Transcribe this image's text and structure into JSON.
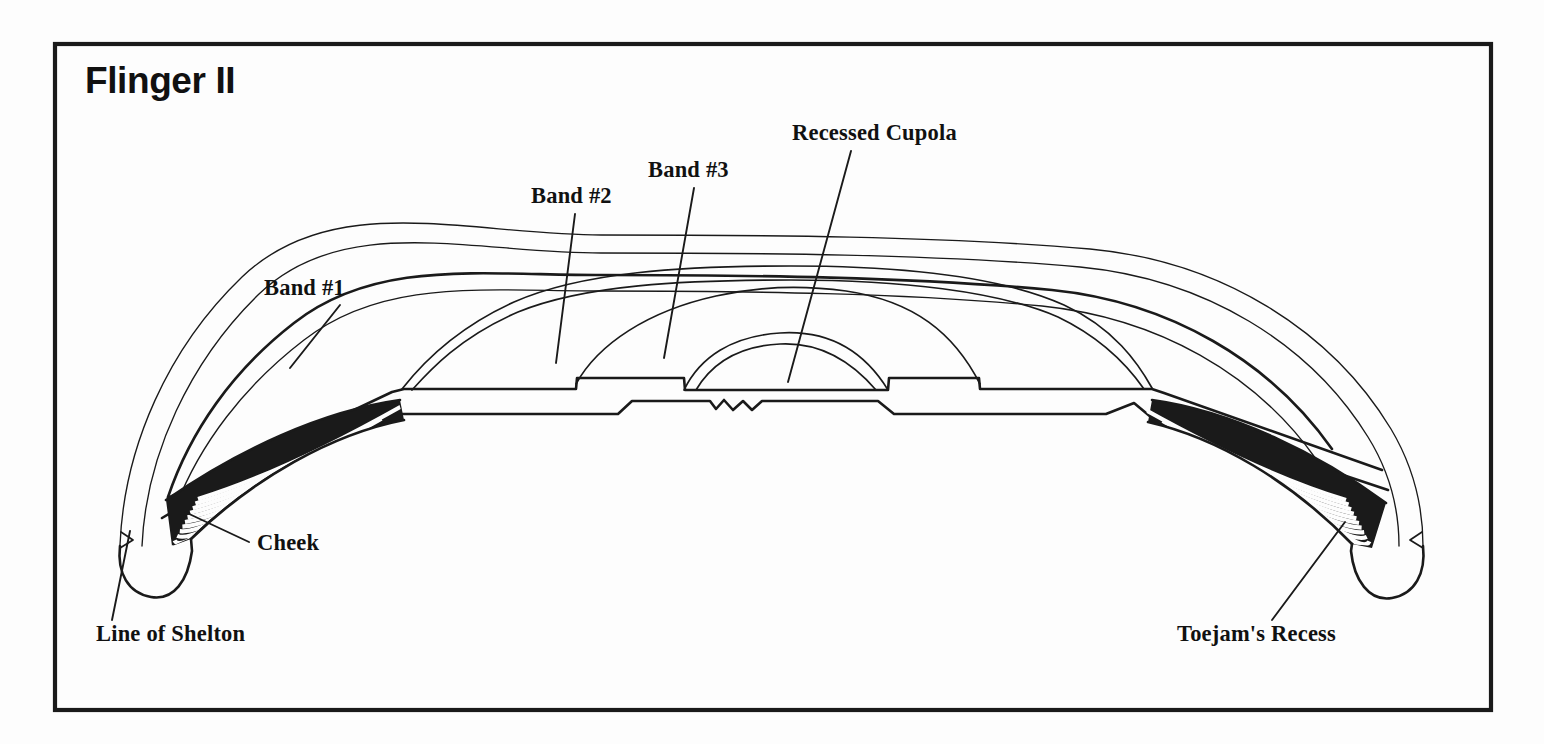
{
  "figure": {
    "title": "Flinger II",
    "background_color": "#fdfdfd",
    "ink_color": "#1a1a1a",
    "frame": {
      "x": 55,
      "y": 44,
      "width": 1436,
      "height": 666
    }
  },
  "callouts": [
    {
      "id": "band-1",
      "label": "Band #1",
      "text_x": 264,
      "text_y": 295,
      "leader": {
        "x1": 340,
        "y1": 305,
        "x2": 290,
        "y2": 368
      }
    },
    {
      "id": "band-2",
      "label": "Band #2",
      "text_x": 531,
      "text_y": 203,
      "leader": {
        "x1": 575,
        "y1": 214,
        "x2": 556,
        "y2": 363
      }
    },
    {
      "id": "band-3",
      "label": "Band #3",
      "text_x": 648,
      "text_y": 177,
      "leader": {
        "x1": 694,
        "y1": 188,
        "x2": 664,
        "y2": 358
      }
    },
    {
      "id": "recessed-cupola",
      "label": "Recessed Cupola",
      "text_x": 792,
      "text_y": 140,
      "leader": {
        "x1": 851,
        "y1": 151,
        "x2": 788,
        "y2": 382
      }
    },
    {
      "id": "cheek",
      "label": "Cheek",
      "text_x": 257,
      "text_y": 550,
      "leader": {
        "x1": 249,
        "y1": 542,
        "x2": 185,
        "y2": 512
      }
    },
    {
      "id": "line-of-shelton",
      "label": "Line of Shelton",
      "text_x": 96,
      "text_y": 641,
      "leader": {
        "x1": 112,
        "y1": 620,
        "x2": 130,
        "y2": 531
      }
    },
    {
      "id": "toejams-recess",
      "label": "Toejam's Recess",
      "text_x": 1177,
      "text_y": 641,
      "leader": {
        "x1": 1272,
        "y1": 620,
        "x2": 1345,
        "y2": 522
      }
    }
  ],
  "geometry": {
    "outer_shell": "M 120 545 C 126 448 170 349 243 278 C 333 192 470 236 600 236 C 760 236 940 236 1090 250 C 1220 262 1330 330 1390 430 C 1415 472 1422 512 1422 546",
    "outer_shell_inner": "M 140 545 C 146 452 188 359 257 292 C 343 212 472 252 600 252 C 758 252 936 252 1082 266 C 1208 278 1312 342 1370 438 C 1392 475 1400 512 1400 546",
    "band1_top": "M 166 494 C 186 430 228 370 290 323 C 372 261 478 276 600 276 C 748 276 912 276 1050 290 C 1168 302 1268 360 1330 448",
    "band1_mid": "M 176 500 C 198 440 240 382 300 336 C 380 276 482 290 600 290 C 744 290 906 290 1040 304 C 1156 316 1254 372 1314 456",
    "band2_top": "M 404 388 C 420 368 452 330 512 304 C 580 275 680 268 790 268 C 900 268 1000 278 1062 306 C 1112 328 1136 362 1150 386",
    "band2_mid": "M 412 390 C 428 372 458 338 516 314 C 582 288 680 282 790 282 C 898 282 996 292 1056 318 C 1104 340 1128 368 1142 388",
    "band3_arc": "M 576 380 C 600 344 648 312 716 297 C 760 287 800 286 844 292 C 912 302 952 332 978 380",
    "cupola_outer": "M 682 388 C 700 358 730 338 778 334 C 826 330 862 350 886 388",
    "cupola_inner": "M 694 389 C 712 364 740 348 780 345 C 820 342 852 360 874 389",
    "base_upper": "M 168 496 L 392 392 L 404 388 L 576 388 L 576 378 L 682 378 L 682 388 L 886 388 L 886 378 L 978 378 L 978 388 L 1150 388 L 1162 392 L 1380 468",
    "base_lower": "M 160 516 L 330 418 L 400 412 L 620 412 L 630 400 L 712 400 L 718 408 L 726 399 L 736 410 L 748 400 L 758 409 L 766 400 L 880 400 L 892 412 L 1108 412 L 1136 402 L 1150 416 L 1240 440 L 1390 486",
    "cheek_left_hatch_region": "M 166 500 L 398 404 L 398 420 L 190 540 L 175 545 Z",
    "cheek_right_hatch_region": "M 1152 404 L 1384 500 L 1378 548 L 1356 545 L 1152 420 Z",
    "tip_left": "M 120 545 C 118 572 128 592 150 596 C 172 600 186 580 190 552 L 190 540",
    "tip_right": "M 1422 546 C 1424 574 1412 594 1390 597 C 1366 600 1352 578 1350 550 L 1350 540",
    "shelton_notch_left": "M 121 533 L 131 540 L 120 547",
    "shelton_notch_right": "M 1421 533 L 1411 540 L 1422 547"
  }
}
